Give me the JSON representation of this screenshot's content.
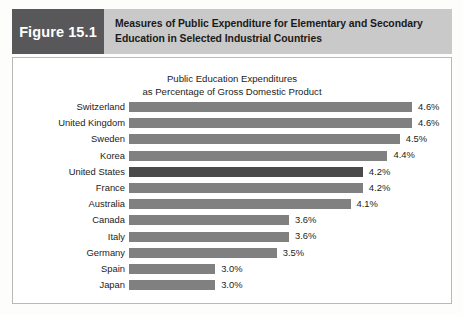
{
  "figure": {
    "badge_label": "Figure 15.1",
    "title_line_1": "Measures of Public Expenditure for Elementary and Secondary",
    "title_line_2": "Education in Selected Industrial Countries",
    "badge_bg": "#58585a",
    "title_bg": "#c9c9c9"
  },
  "chart_data": {
    "type": "bar",
    "orientation": "horizontal",
    "title": "Public Education Expenditures as Percentage of Gross Domestic Product",
    "title_line_1": "Public Education Expenditures",
    "title_line_2": "as Percentage of Gross Domestic Product",
    "xlabel": "",
    "ylabel": "",
    "grid": false,
    "legend": "none",
    "value_suffix": "%",
    "bar_color": "#808080",
    "highlight_color": "#4a4a4a",
    "highlight_category": "United States",
    "axis_base": 2.3,
    "axis_max": 4.9,
    "categories": [
      "Switzerland",
      "United Kingdom",
      "Sweden",
      "Korea",
      "United States",
      "France",
      "Australia",
      "Canada",
      "Italy",
      "Germany",
      "Spain",
      "Japan"
    ],
    "values": [
      4.6,
      4.6,
      4.5,
      4.4,
      4.2,
      4.2,
      4.1,
      3.6,
      3.6,
      3.5,
      3.0,
      3.0
    ],
    "value_labels": [
      "4.6%",
      "4.6%",
      "4.5%",
      "4.4%",
      "4.2%",
      "4.2%",
      "4.1%",
      "3.6%",
      "3.6%",
      "3.5%",
      "3.0%",
      "3.0%"
    ],
    "rows": [
      {
        "label": "Switzerland",
        "value": 4.6,
        "value_label": "4.6%",
        "highlight": false
      },
      {
        "label": "United Kingdom",
        "value": 4.6,
        "value_label": "4.6%",
        "highlight": false
      },
      {
        "label": "Sweden",
        "value": 4.5,
        "value_label": "4.5%",
        "highlight": false
      },
      {
        "label": "Korea",
        "value": 4.4,
        "value_label": "4.4%",
        "highlight": false
      },
      {
        "label": "United States",
        "value": 4.2,
        "value_label": "4.2%",
        "highlight": true
      },
      {
        "label": "France",
        "value": 4.2,
        "value_label": "4.2%",
        "highlight": false
      },
      {
        "label": "Australia",
        "value": 4.1,
        "value_label": "4.1%",
        "highlight": false
      },
      {
        "label": "Canada",
        "value": 3.6,
        "value_label": "3.6%",
        "highlight": false
      },
      {
        "label": "Italy",
        "value": 3.6,
        "value_label": "3.6%",
        "highlight": false
      },
      {
        "label": "Germany",
        "value": 3.5,
        "value_label": "3.5%",
        "highlight": false
      },
      {
        "label": "Spain",
        "value": 3.0,
        "value_label": "3.0%",
        "highlight": false
      },
      {
        "label": "Japan",
        "value": 3.0,
        "value_label": "3.0%",
        "highlight": false
      }
    ]
  }
}
